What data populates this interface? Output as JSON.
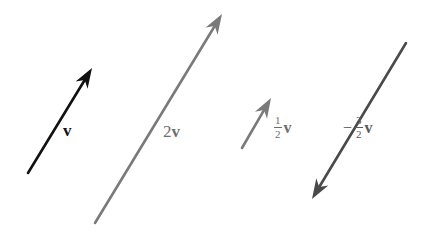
{
  "diagram": {
    "title": "",
    "vectors": [
      {
        "id": "v",
        "label": {
          "coef": "",
          "num": "",
          "den": "",
          "sign": "",
          "var": "v"
        },
        "tail": [
          28,
          173
        ],
        "head": [
          92,
          68
        ],
        "color": "#111111",
        "label_pos": [
          63,
          122
        ],
        "label_color": "#111111"
      },
      {
        "id": "2v",
        "label": {
          "coef": "2",
          "num": "",
          "den": "",
          "sign": "",
          "var": "v"
        },
        "tail": [
          95,
          223
        ],
        "head": [
          222,
          14
        ],
        "color": "#7a7a7a",
        "label_pos": [
          163,
          123
        ],
        "label_color": "#6e6e6e"
      },
      {
        "id": "half-v",
        "label": {
          "coef": "",
          "num": "1",
          "den": "2",
          "sign": "",
          "var": "v"
        },
        "tail": [
          242,
          148
        ],
        "head": [
          271,
          98
        ],
        "color": "#7a7a7a",
        "label_pos": [
          274,
          115
        ],
        "label_color": "#6e6e6e"
      },
      {
        "id": "neg-three-halves-v",
        "label": {
          "coef": "",
          "num": "3",
          "den": "2",
          "sign": "−",
          "var": "v"
        },
        "tail": [
          406,
          43
        ],
        "head": [
          312,
          199
        ],
        "color": "#4a4a4a",
        "label_pos": [
          343,
          115
        ],
        "label_color": "#5a5a5a"
      }
    ]
  }
}
